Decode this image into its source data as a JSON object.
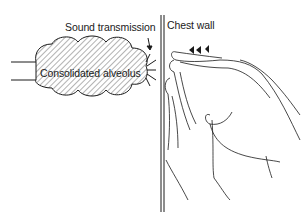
{
  "figure": {
    "labels": {
      "sound_transmission": "Sound transmission",
      "chest_wall": "Chest wall",
      "consolidated_alveolus": "Consolidated alveolus"
    },
    "colors": {
      "ink": "#1a1a1a",
      "background": "#ffffff",
      "hatch": "#555555"
    }
  }
}
